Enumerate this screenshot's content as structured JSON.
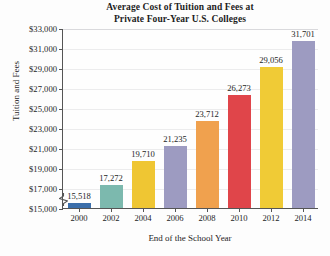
{
  "chart_data": {
    "type": "bar",
    "title": "Average Cost of Tuition and Fees at Private Four-Year U.S. Colleges",
    "title_lines": [
      "Average Cost of Tuition and Fees at",
      "Private Four-Year U.S. Colleges"
    ],
    "xlabel": "End of the School Year",
    "ylabel": "Tuition and Fees",
    "categories": [
      "2000",
      "2002",
      "2004",
      "2006",
      "2008",
      "2010",
      "2012",
      "2014"
    ],
    "values": [
      15518,
      17272,
      19710,
      21235,
      23712,
      26273,
      29056,
      31701
    ],
    "value_labels": [
      "15,518",
      "17,272",
      "19,710",
      "21,235",
      "23,712",
      "26,273",
      "29,056",
      "31,701"
    ],
    "ylim": [
      15000,
      33000
    ],
    "ytick_values": [
      15000,
      17000,
      19000,
      21000,
      23000,
      25000,
      27000,
      29000,
      31000,
      33000
    ],
    "ytick_labels": [
      "$15,000",
      "$17,000",
      "$19,000",
      "$21,000",
      "$23,000",
      "$25,000",
      "$27,000",
      "$29,000",
      "$31,000",
      "$33,000"
    ],
    "grid": true,
    "legend": "none",
    "axis_break": true,
    "bar_colors": [
      "#3c6fab",
      "#7cb9ae",
      "#efc633",
      "#9d9bc1",
      "#f0a14e",
      "#e0454a",
      "#f0cb36",
      "#9d9bc1"
    ],
    "series": [
      {
        "name": "Average cost of tuition and fees",
        "values": [
          15518,
          17272,
          19710,
          21235,
          23712,
          26273,
          29056,
          31701
        ]
      }
    ]
  }
}
